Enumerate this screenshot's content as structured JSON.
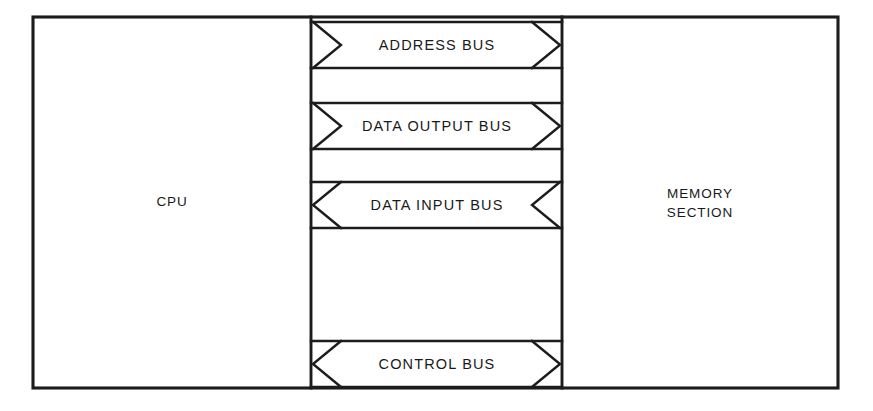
{
  "diagram": {
    "type": "block-diagram",
    "canvas": {
      "width": 873,
      "height": 411,
      "background": "#ffffff"
    },
    "line_color": "#1c1c1c",
    "text_color": "#1a1a1a",
    "outer_frame": {
      "x": 33,
      "y": 17,
      "width": 805,
      "height": 371
    },
    "dividers": {
      "left_x": 311,
      "right_x": 562
    },
    "blocks": [
      {
        "id": "cpu",
        "label": "CPU",
        "label_lines": [
          "CPU"
        ],
        "region": {
          "x": 33,
          "y": 17,
          "width": 278,
          "height": 371
        }
      },
      {
        "id": "memory",
        "label": "MEMORY SECTION",
        "label_lines": [
          "MEMORY",
          "SECTION"
        ],
        "region": {
          "x": 562,
          "y": 17,
          "width": 276,
          "height": 371
        }
      }
    ],
    "buses": [
      {
        "id": "address-bus",
        "label": "ADDRESS BUS",
        "direction": "cpu-to-memory",
        "left_chevron": "right",
        "right_chevron": "right",
        "band": {
          "top": 22,
          "bottom": 68
        }
      },
      {
        "id": "data-output-bus",
        "label": "DATA OUTPUT BUS",
        "direction": "cpu-to-memory",
        "left_chevron": "right",
        "right_chevron": "right",
        "band": {
          "top": 103,
          "bottom": 149
        }
      },
      {
        "id": "data-input-bus",
        "label": "DATA INPUT BUS",
        "direction": "memory-to-cpu",
        "left_chevron": "left",
        "right_chevron": "left",
        "band": {
          "top": 182,
          "bottom": 228
        }
      },
      {
        "id": "control-bus",
        "label": "CONTROL BUS",
        "direction": "bidirectional",
        "left_chevron": "left",
        "right_chevron": "right",
        "band": {
          "top": 341,
          "bottom": 387
        }
      }
    ]
  }
}
